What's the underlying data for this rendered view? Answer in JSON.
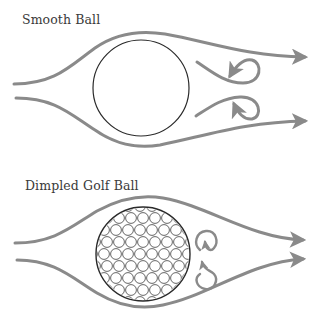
{
  "panels": [
    {
      "title": "Smooth Ball",
      "ball": {
        "cx": 141,
        "cy": 88,
        "r": 48,
        "dimpled": false
      },
      "vortex_size": "large"
    },
    {
      "title": "Dimpled Golf Ball",
      "ball": {
        "cx": 143,
        "cy": 254,
        "r": 47,
        "dimpled": true
      },
      "vortex_size": "small"
    }
  ],
  "colors": {
    "streamline": "#8a8a8a",
    "ball_outline": "#2a2a2a",
    "dimple_outline": "#555555",
    "text": "#3a3a3a"
  }
}
